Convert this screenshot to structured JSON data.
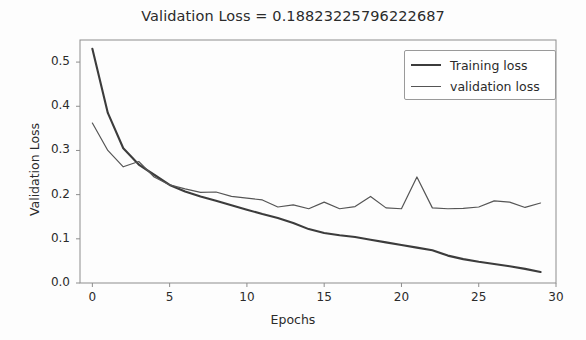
{
  "chart_data": {
    "type": "line",
    "title": "Validation Loss = 0.18823225796222687",
    "xlabel": "Epochs",
    "ylabel": "Validation Loss",
    "xlim": [
      -0.8,
      30
    ],
    "ylim": [
      0.0,
      0.55
    ],
    "xticks": [
      "0",
      "5",
      "10",
      "15",
      "20",
      "25",
      "30"
    ],
    "xtick_values": [
      0,
      5,
      10,
      15,
      20,
      25,
      30
    ],
    "yticks": [
      "0.0",
      "0.1",
      "0.2",
      "0.3",
      "0.4",
      "0.5"
    ],
    "ytick_values": [
      0.0,
      0.1,
      0.2,
      0.3,
      0.4,
      0.5
    ],
    "grid": false,
    "legend_position": "upper right",
    "x": [
      0,
      1,
      2,
      3,
      4,
      5,
      6,
      7,
      8,
      9,
      10,
      11,
      12,
      13,
      14,
      15,
      16,
      17,
      18,
      19,
      20,
      21,
      22,
      23,
      24,
      25,
      26,
      27,
      28,
      29
    ],
    "series": [
      {
        "name": "Training loss",
        "color": "#3c3c3c",
        "width": 2.1,
        "values": [
          0.53,
          0.385,
          0.305,
          0.268,
          0.245,
          0.222,
          0.207,
          0.196,
          0.186,
          0.176,
          0.166,
          0.156,
          0.147,
          0.136,
          0.122,
          0.113,
          0.108,
          0.104,
          0.098,
          0.092,
          0.086,
          0.08,
          0.074,
          0.062,
          0.054,
          0.048,
          0.043,
          0.038,
          0.032,
          0.025
        ]
      },
      {
        "name": "validation loss",
        "color": "#555555",
        "width": 1.2,
        "values": [
          0.362,
          0.3,
          0.263,
          0.275,
          0.24,
          0.222,
          0.213,
          0.205,
          0.206,
          0.196,
          0.192,
          0.188,
          0.172,
          0.177,
          0.168,
          0.183,
          0.168,
          0.173,
          0.196,
          0.17,
          0.168,
          0.24,
          0.17,
          0.168,
          0.169,
          0.172,
          0.186,
          0.183,
          0.171,
          0.181
        ]
      }
    ],
    "annotations": []
  },
  "legend": {
    "entries": [
      {
        "label": "Training loss"
      },
      {
        "label": "validation loss"
      }
    ]
  }
}
